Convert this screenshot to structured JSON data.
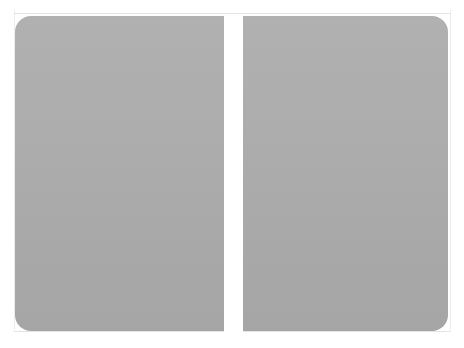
{
  "top_caption": "",
  "figure": {
    "panels": [
      {
        "name": "left-page",
        "color": "#acacac"
      },
      {
        "name": "right-page",
        "color": "#acacac"
      }
    ],
    "gap_color": "#ffffff"
  },
  "bottom_caption": ""
}
